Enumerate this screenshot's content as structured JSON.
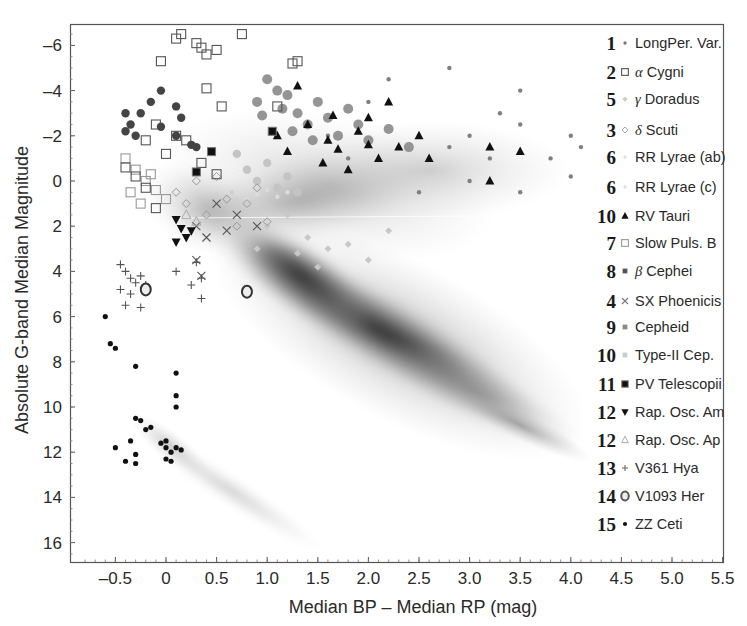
{
  "chart_data": {
    "type": "scatter",
    "title": "",
    "xlabel": "Median BP – Median RP (mag)",
    "ylabel": "Absolute G-band Median Magnitude",
    "xlim": [
      -0.85,
      5.6
    ],
    "ylim": [
      17,
      -7
    ],
    "y_inverted": true,
    "grid": false,
    "legend_position": "right-inside",
    "x_ticks": [
      -0.5,
      0,
      0.5,
      1.0,
      1.5,
      2.0,
      2.5,
      3.0,
      3.5,
      4.0,
      4.5,
      5.0,
      5.5
    ],
    "x_tick_labels": [
      "–0.5",
      "0",
      "0.5",
      "1.0",
      "1.5",
      "2.0",
      "2.5",
      "3.0",
      "3.5",
      "4.0",
      "4.5",
      "5.0",
      "5.5"
    ],
    "y_ticks": [
      -6,
      -4,
      -2,
      0,
      2,
      4,
      6,
      8,
      10,
      12,
      14,
      16
    ],
    "y_tick_labels": [
      "–6",
      "–4",
      "–2",
      "0",
      "2",
      "4",
      "6",
      "8",
      "10",
      "12",
      "14",
      "16"
    ],
    "background_density": {
      "description": "Grey density of non-variable reference stars (HR diagram)",
      "main_sequence": [
        [
          0.0,
          1.5
        ],
        [
          0.5,
          3.5
        ],
        [
          1.0,
          5.5
        ],
        [
          1.5,
          7.0
        ],
        [
          2.0,
          8.5
        ],
        [
          2.5,
          10.0
        ],
        [
          3.0,
          11.5
        ],
        [
          3.5,
          13.0
        ]
      ],
      "giant_branch": [
        [
          1.0,
          1.5
        ],
        [
          1.5,
          0.0
        ],
        [
          2.0,
          -1.0
        ],
        [
          2.5,
          -1.5
        ]
      ],
      "white_dwarf_sequence": [
        [
          -0.3,
          10.5
        ],
        [
          0.0,
          12.0
        ],
        [
          0.5,
          13.5
        ],
        [
          1.0,
          14.5
        ],
        [
          1.3,
          15.0
        ]
      ]
    },
    "series": [
      {
        "id": 1,
        "name": "LongPer. Var.",
        "marker": "small-dot",
        "color": "#808080",
        "points": [
          [
            1.6,
            -2.0
          ],
          [
            2.0,
            -3.5
          ],
          [
            2.5,
            -2.0
          ],
          [
            2.8,
            -1.5
          ],
          [
            3.0,
            -2.0
          ],
          [
            3.2,
            -1.0
          ],
          [
            3.5,
            -2.5
          ],
          [
            3.8,
            -1.0
          ],
          [
            4.0,
            -2.0
          ],
          [
            2.2,
            -4.5
          ],
          [
            2.8,
            -5.0
          ],
          [
            3.5,
            -4.0
          ],
          [
            3.0,
            0.0
          ],
          [
            3.5,
            0.5
          ],
          [
            2.5,
            0.5
          ],
          [
            4.0,
            -0.2
          ],
          [
            1.8,
            -1.0
          ],
          [
            2.3,
            -1.5
          ],
          [
            3.3,
            -3.0
          ],
          [
            4.1,
            -1.5
          ]
        ]
      },
      {
        "id": 2,
        "name": "α Cygni",
        "marker": "open-square",
        "color": "#555555",
        "points": [
          [
            -0.05,
            -5.3
          ],
          [
            0.1,
            -6.3
          ],
          [
            0.15,
            -6.5
          ],
          [
            0.3,
            -6.1
          ],
          [
            0.35,
            -5.9
          ],
          [
            0.4,
            -5.6
          ],
          [
            0.5,
            -5.8
          ],
          [
            0.75,
            -6.5
          ],
          [
            1.25,
            -5.2
          ],
          [
            1.3,
            -5.3
          ],
          [
            0.4,
            -4.1
          ],
          [
            0.55,
            -3.3
          ],
          [
            -0.2,
            -1.8
          ],
          [
            -0.1,
            -2.5
          ],
          [
            0.0,
            -1.2
          ],
          [
            -0.4,
            -0.6
          ],
          [
            -0.3,
            -0.2
          ],
          [
            -0.2,
            0.3
          ],
          [
            -0.1,
            1.2
          ],
          [
            0.1,
            -2.0
          ],
          [
            0.2,
            -1.8
          ],
          [
            0.35,
            -0.8
          ],
          [
            0.5,
            -0.3
          ],
          [
            1.1,
            -3.3
          ]
        ]
      },
      {
        "id": 5,
        "name": "γ Doradus",
        "marker": "small-diamond",
        "color": "#c8c8c8",
        "points": [
          [
            1.0,
            2.0
          ],
          [
            1.2,
            1.5
          ],
          [
            1.4,
            2.5
          ],
          [
            1.6,
            3.0
          ],
          [
            1.8,
            2.8
          ],
          [
            2.0,
            3.5
          ],
          [
            2.2,
            2.2
          ],
          [
            1.5,
            3.8
          ],
          [
            1.3,
            3.2
          ],
          [
            0.9,
            3.0
          ]
        ]
      },
      {
        "id": 3,
        "name": "δ Scuti",
        "marker": "open-diamond",
        "color": "#999999",
        "points": [
          [
            0.1,
            0.5
          ],
          [
            0.2,
            1.0
          ],
          [
            0.3,
            0.0
          ],
          [
            0.4,
            1.5
          ],
          [
            0.5,
            -0.2
          ],
          [
            0.6,
            0.8
          ],
          [
            0.7,
            2.0
          ],
          [
            0.8,
            1.0
          ],
          [
            0.9,
            0.3
          ],
          [
            1.0,
            1.8
          ]
        ]
      },
      {
        "id": 6,
        "name": "RR Lyrae (ab)",
        "marker": "small-dot",
        "color": "#dcdcdc",
        "points": [
          [
            0.7,
            0.5
          ],
          [
            0.8,
            0.8
          ],
          [
            0.9,
            0.6
          ],
          [
            1.0,
            0.4
          ],
          [
            1.1,
            0.7
          ],
          [
            1.2,
            0.5
          ]
        ]
      },
      {
        "id": 6,
        "name": "RR Lyrae (c)",
        "marker": "small-dot",
        "color": "#d0d0d0",
        "points": [
          [
            0.5,
            0.6
          ],
          [
            0.6,
            0.7
          ],
          [
            0.65,
            0.5
          ],
          [
            0.7,
            0.8
          ]
        ]
      },
      {
        "id": 10,
        "name": "RV Tauri",
        "marker": "filled-triangle",
        "color": "#111111",
        "points": [
          [
            1.3,
            -4.2
          ],
          [
            1.4,
            -2.5
          ],
          [
            1.1,
            -2.0
          ],
          [
            1.2,
            -1.3
          ],
          [
            1.55,
            -0.8
          ],
          [
            1.6,
            -1.8
          ],
          [
            1.7,
            -1.4
          ],
          [
            1.8,
            -0.5
          ],
          [
            1.9,
            -2.2
          ],
          [
            2.0,
            -2.8
          ],
          [
            2.1,
            -1.0
          ],
          [
            2.2,
            -3.5
          ],
          [
            2.3,
            -1.5
          ],
          [
            2.5,
            -2.0
          ],
          [
            2.6,
            -1.0
          ],
          [
            3.2,
            -1.5
          ],
          [
            3.5,
            -1.3
          ],
          [
            3.2,
            0.0
          ],
          [
            1.65,
            -2.9
          ],
          [
            2.0,
            -1.6
          ]
        ]
      },
      {
        "id": 7,
        "name": "Slow Puls. B",
        "marker": "open-square",
        "color": "#999999",
        "points": [
          [
            -0.4,
            -1.0
          ],
          [
            -0.3,
            -0.5
          ],
          [
            -0.2,
            0.0
          ],
          [
            -0.1,
            0.4
          ],
          [
            0.0,
            0.8
          ],
          [
            -0.35,
            0.5
          ],
          [
            -0.25,
            1.0
          ],
          [
            -0.15,
            -0.3
          ]
        ]
      },
      {
        "id": 8,
        "name": "β Cephei",
        "marker": "filled-circle",
        "color": "#444444",
        "points": [
          [
            -0.05,
            -4.0
          ],
          [
            -0.15,
            -3.5
          ],
          [
            -0.35,
            -2.5
          ],
          [
            -0.4,
            -2.2
          ],
          [
            -0.3,
            -2.0
          ],
          [
            0.1,
            -3.3
          ],
          [
            -0.05,
            -2.4
          ],
          [
            0.1,
            -2.0
          ],
          [
            0.25,
            -1.6
          ],
          [
            0.3,
            -1.5
          ],
          [
            0.15,
            -2.8
          ],
          [
            -0.25,
            -3.0
          ],
          [
            -0.4,
            -3.0
          ]
        ]
      },
      {
        "id": 4,
        "name": "SX Phoenicis",
        "marker": "cross-x",
        "color": "#555555",
        "points": [
          [
            0.3,
            2.0
          ],
          [
            0.4,
            2.5
          ],
          [
            0.5,
            1.0
          ],
          [
            0.6,
            2.2
          ],
          [
            0.7,
            1.5
          ],
          [
            0.3,
            3.5
          ],
          [
            0.35,
            4.2
          ],
          [
            0.9,
            2.0
          ]
        ]
      },
      {
        "id": 9,
        "name": "Cepheid",
        "marker": "filled-circle-large",
        "color": "#8a8a8a",
        "points": [
          [
            0.9,
            -3.5
          ],
          [
            1.0,
            -4.5
          ],
          [
            1.1,
            -4.0
          ],
          [
            1.2,
            -3.8
          ],
          [
            1.3,
            -3.0
          ],
          [
            1.4,
            -2.5
          ],
          [
            1.5,
            -3.5
          ],
          [
            1.6,
            -2.8
          ],
          [
            1.7,
            -2.0
          ],
          [
            1.8,
            -3.2
          ],
          [
            1.9,
            -2.5
          ],
          [
            2.0,
            -1.8
          ],
          [
            2.2,
            -2.3
          ],
          [
            2.4,
            -1.5
          ],
          [
            0.95,
            -2.9
          ],
          [
            1.15,
            -3.2
          ],
          [
            1.45,
            -1.8
          ],
          [
            1.25,
            -2.2
          ]
        ]
      },
      {
        "id": 10,
        "name": "Type-II Cep.",
        "marker": "filled-circle",
        "color": "#c4c4c4",
        "points": [
          [
            0.8,
            -0.5
          ],
          [
            0.9,
            0.0
          ],
          [
            1.0,
            -0.8
          ],
          [
            1.1,
            0.3
          ],
          [
            1.2,
            -0.2
          ],
          [
            1.3,
            0.5
          ],
          [
            0.7,
            -1.2
          ]
        ]
      },
      {
        "id": 11,
        "name": "PV Telescopii",
        "marker": "filled-square",
        "color": "#111111",
        "points": [
          [
            1.05,
            -2.2
          ],
          [
            0.45,
            -1.3
          ],
          [
            0.3,
            -0.4
          ]
        ]
      },
      {
        "id": 12,
        "name": "Rap. Osc. Am",
        "marker": "filled-triangle-down",
        "color": "#111111",
        "points": [
          [
            0.1,
            1.7
          ],
          [
            0.15,
            2.1
          ],
          [
            0.2,
            2.5
          ],
          [
            0.1,
            2.7
          ],
          [
            0.25,
            2.2
          ]
        ]
      },
      {
        "id": 12,
        "name": "Rap. Osc. Ap",
        "marker": "open-triangle",
        "color": "#aaaaaa",
        "points": [
          [
            0.2,
            1.5
          ],
          [
            0.3,
            1.8
          ]
        ]
      },
      {
        "id": 13,
        "name": "V361 Hya",
        "marker": "plus",
        "color": "#555555",
        "points": [
          [
            -0.45,
            3.7
          ],
          [
            -0.4,
            4.0
          ],
          [
            -0.35,
            4.3
          ],
          [
            -0.3,
            4.5
          ],
          [
            -0.45,
            4.8
          ],
          [
            -0.35,
            5.0
          ],
          [
            -0.25,
            4.2
          ],
          [
            -0.2,
            4.6
          ],
          [
            -0.4,
            5.5
          ],
          [
            -0.25,
            5.6
          ],
          [
            0.1,
            4.0
          ],
          [
            0.3,
            3.6
          ],
          [
            0.35,
            4.3
          ],
          [
            0.25,
            4.6
          ],
          [
            0.35,
            5.2
          ]
        ]
      },
      {
        "id": 14,
        "name": "V1093 Her",
        "marker": "open-circle",
        "color": "#333333",
        "points": [
          [
            0.8,
            4.9
          ],
          [
            -0.2,
            4.8
          ]
        ]
      },
      {
        "id": 15,
        "name": "ZZ Ceti",
        "marker": "small-filled-dot",
        "color": "#111111",
        "points": [
          [
            -0.6,
            6.0
          ],
          [
            -0.55,
            7.2
          ],
          [
            -0.5,
            7.4
          ],
          [
            -0.3,
            8.2
          ],
          [
            0.1,
            8.5
          ],
          [
            0.1,
            9.5
          ],
          [
            0.1,
            10.0
          ],
          [
            -0.3,
            10.5
          ],
          [
            -0.25,
            10.6
          ],
          [
            -0.2,
            11.0
          ],
          [
            -0.15,
            10.9
          ],
          [
            -0.35,
            11.5
          ],
          [
            -0.5,
            11.8
          ],
          [
            -0.3,
            12.1
          ],
          [
            -0.4,
            12.4
          ],
          [
            -0.3,
            12.5
          ],
          [
            0.0,
            11.5
          ],
          [
            0.0,
            11.8
          ],
          [
            0.05,
            12.0
          ],
          [
            0.0,
            12.3
          ],
          [
            0.1,
            11.8
          ],
          [
            0.15,
            11.9
          ],
          [
            -0.05,
            11.6
          ],
          [
            0.05,
            12.4
          ]
        ]
      }
    ]
  },
  "legend": {
    "items": [
      {
        "num": "1",
        "greek": "",
        "label": "LongPer. Var.",
        "marker": "small-dot"
      },
      {
        "num": "2",
        "greek": "α",
        "label": " Cygni",
        "marker": "open-square"
      },
      {
        "num": "5",
        "greek": "γ",
        "label": " Doradus",
        "marker": "small-diamond"
      },
      {
        "num": "3",
        "greek": "δ",
        "label": " Scuti",
        "marker": "open-diamond"
      },
      {
        "num": "6",
        "greek": "",
        "label": "RR Lyrae (ab)",
        "marker": "small-dot-light"
      },
      {
        "num": "6",
        "greek": "",
        "label": "RR Lyrae (c)",
        "marker": "small-dot-light"
      },
      {
        "num": "10",
        "greek": "",
        "label": "RV Tauri",
        "marker": "filled-triangle"
      },
      {
        "num": "7",
        "greek": "",
        "label": "Slow Puls. B",
        "marker": "open-square-light"
      },
      {
        "num": "8",
        "greek": "β",
        "label": " Cephei",
        "marker": "filled-square-dark"
      },
      {
        "num": "4",
        "greek": "",
        "label": "SX Phoenicis",
        "marker": "cross-x"
      },
      {
        "num": "9",
        "greek": "",
        "label": "Cepheid",
        "marker": "filled-square-grey"
      },
      {
        "num": "10",
        "greek": "",
        "label": "Type-II Cep.",
        "marker": "filled-square-light"
      },
      {
        "num": "11",
        "greek": "",
        "label": "PV Telescopii",
        "marker": "filled-square"
      },
      {
        "num": "12",
        "greek": "",
        "label": "Rap. Osc. Am",
        "marker": "filled-triangle-down"
      },
      {
        "num": "12",
        "greek": "",
        "label": "Rap. Osc. Ap",
        "marker": "open-triangle"
      },
      {
        "num": "13",
        "greek": "",
        "label": "V361 Hya",
        "marker": "plus"
      },
      {
        "num": "14",
        "greek": "",
        "label": "V1093 Her",
        "marker": "open-circle"
      },
      {
        "num": "15",
        "greek": "",
        "label": "ZZ Ceti",
        "marker": "small-filled-dot"
      }
    ]
  }
}
